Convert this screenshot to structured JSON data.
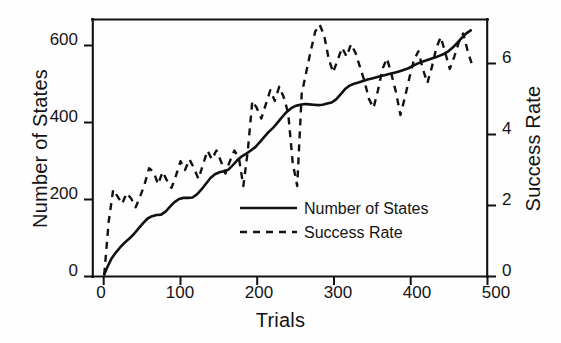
{
  "chart_data": {
    "type": "line",
    "title": "",
    "xlabel": "Trials",
    "ylabel": "Number of States",
    "ylabel_right": "Success Rate",
    "xlim": [
      -15,
      512
    ],
    "ylim": [
      0,
      672
    ],
    "ylim_right": [
      0,
      7.23
    ],
    "xticks": [
      "0",
      "100",
      "200",
      "300",
      "400",
      "500"
    ],
    "xtick_values": [
      0,
      100,
      200,
      300,
      400,
      500
    ],
    "yticks": [
      "0",
      "200",
      "400",
      "600"
    ],
    "ytick_values": [
      0,
      200,
      400,
      600
    ],
    "yticks_right": [
      "0",
      "2",
      "4",
      "6"
    ],
    "ytick_right_values": [
      0,
      2,
      4,
      6
    ],
    "grid": false,
    "legend_position": "center-right-inside",
    "series": [
      {
        "name": "Number of States",
        "style": "solid",
        "axis": "left",
        "color": "#111111",
        "x": [
          0,
          5,
          10,
          16,
          22,
          28,
          34,
          40,
          46,
          52,
          58,
          64,
          70,
          76,
          82,
          88,
          94,
          100,
          106,
          112,
          118,
          124,
          130,
          136,
          142,
          148,
          154,
          160,
          166,
          172,
          178,
          184,
          190,
          196,
          202,
          208,
          214,
          220,
          226,
          232,
          238,
          244,
          250,
          256,
          262,
          268,
          274,
          280,
          286,
          292,
          298,
          304,
          310,
          316,
          322,
          328,
          334,
          340,
          346,
          352,
          358,
          364,
          370,
          376,
          382,
          388,
          394,
          400,
          406,
          412,
          418,
          424,
          430,
          436,
          442,
          448,
          454,
          460,
          466,
          472,
          478,
          484,
          490
        ],
        "y": [
          5,
          28,
          48,
          64,
          78,
          90,
          100,
          112,
          126,
          140,
          152,
          158,
          161,
          162,
          170,
          183,
          195,
          203,
          206,
          206,
          207,
          215,
          228,
          243,
          258,
          268,
          273,
          276,
          280,
          292,
          305,
          315,
          322,
          330,
          339,
          352,
          366,
          379,
          390,
          404,
          418,
          431,
          441,
          447,
          450,
          452,
          451,
          450,
          449,
          450,
          453,
          456,
          464,
          477,
          491,
          500,
          505,
          508,
          512,
          516,
          519,
          522,
          525,
          528,
          531,
          534,
          537,
          541,
          545,
          551,
          557,
          562,
          566,
          570,
          574,
          578,
          583,
          590,
          600,
          612,
          625,
          637,
          645
        ]
      },
      {
        "name": "Success Rate",
        "style": "dashed",
        "axis": "right",
        "color": "#111111",
        "x": [
          0,
          6,
          12,
          18,
          24,
          30,
          36,
          42,
          48,
          54,
          60,
          66,
          72,
          78,
          84,
          90,
          96,
          102,
          108,
          114,
          120,
          126,
          132,
          138,
          144,
          150,
          156,
          162,
          168,
          174,
          180,
          186,
          192,
          198,
          204,
          210,
          216,
          222,
          228,
          234,
          240,
          246,
          252,
          258,
          264,
          270,
          276,
          282,
          288,
          294,
          300,
          306,
          312,
          318,
          324,
          330,
          336,
          342,
          348,
          354,
          360,
          366,
          372,
          378,
          384,
          390,
          396,
          402,
          408,
          414,
          420,
          426,
          432,
          438,
          444,
          450,
          456,
          462,
          468,
          474,
          480,
          486,
          492
        ],
        "y": [
          0.05,
          1.55,
          2.45,
          2.25,
          2.05,
          2.35,
          2.2,
          1.95,
          2.25,
          2.6,
          3.05,
          2.95,
          2.6,
          2.95,
          2.7,
          2.5,
          2.85,
          3.25,
          3.0,
          3.3,
          3.05,
          2.75,
          3.15,
          3.55,
          3.3,
          3.55,
          3.25,
          2.9,
          3.25,
          3.55,
          3.35,
          2.55,
          3.55,
          4.95,
          4.75,
          4.45,
          4.85,
          5.25,
          4.95,
          5.35,
          5.05,
          4.6,
          3.2,
          2.55,
          5.15,
          5.75,
          6.35,
          6.9,
          7.1,
          6.8,
          6.15,
          5.75,
          6.1,
          6.45,
          6.2,
          6.55,
          6.3,
          5.9,
          5.5,
          5.0,
          4.75,
          5.25,
          5.85,
          6.15,
          5.7,
          5.2,
          4.55,
          5.05,
          5.6,
          6.1,
          6.35,
          5.85,
          5.45,
          5.9,
          6.45,
          6.75,
          6.3,
          5.85,
          6.2,
          6.6,
          6.85,
          6.35,
          5.95
        ]
      }
    ]
  },
  "legend": {
    "items": [
      {
        "label": "Number of States",
        "style": "solid"
      },
      {
        "label": "Success Rate",
        "style": "dashed"
      }
    ]
  },
  "colors": {
    "ink": "#111111",
    "background": "#ffffff"
  }
}
